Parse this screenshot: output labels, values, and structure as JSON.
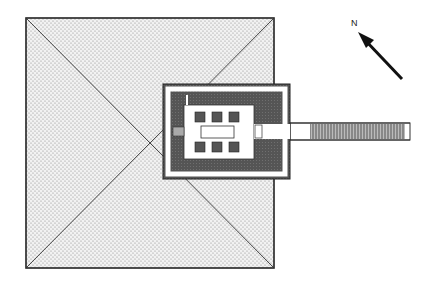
{
  "diagram": {
    "type": "architectural plan",
    "north_label": "N",
    "colors": {
      "pyramid_fill": "#e4e4e4",
      "wall_dark": "#555555",
      "court_light": "#ffffff",
      "outline": "#222222"
    },
    "elements": [
      {
        "name": "pyramid",
        "shape": "square with diagonals, stippled"
      },
      {
        "name": "temple-enclosure",
        "shape": "dark walled rectangle"
      },
      {
        "name": "inner-court",
        "shape": "white rectangle with pillars"
      },
      {
        "name": "causeway",
        "shape": "long hatched corridor to the east"
      },
      {
        "name": "north-arrow",
        "shape": "arrow pointing NW"
      }
    ]
  }
}
